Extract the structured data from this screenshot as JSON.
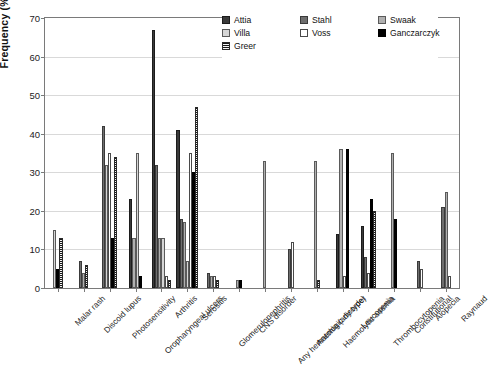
{
  "chart_data": {
    "type": "bar",
    "title": "",
    "subtitle": "",
    "xlabel": "",
    "ylabel": "Frequency (%)",
    "ylim": [
      0,
      70
    ],
    "ytick_step": 10,
    "yticks": [
      0,
      10,
      20,
      30,
      40,
      50,
      60,
      70
    ],
    "grid": true,
    "legend_position": "top-center",
    "categories": [
      "Malar rash",
      "Discoid lupus",
      "Photosensitivity",
      "Oropharyngeal ulcers",
      "Arthritis",
      "Serositis",
      "Glomerulonephritis",
      "CNS disorder",
      "Any hematologic disorder",
      "Anemia (any type)",
      "Haemolytic anemia",
      "Leucopenia",
      "Thrombocytopenia",
      "Constitutional",
      "Alopecia",
      "Raynaud"
    ],
    "series": [
      {
        "name": "Attia",
        "color": "#3a3a3a",
        "pattern": "solid-dark-gray",
        "values": [
          null,
          null,
          null,
          23,
          67,
          41,
          null,
          null,
          null,
          null,
          null,
          14,
          16,
          null,
          null,
          null
        ]
      },
      {
        "name": "Stahl",
        "color": "#6e6e6e",
        "pattern": "solid-medium-gray",
        "values": [
          null,
          7,
          42,
          null,
          32,
          18,
          4,
          null,
          null,
          10,
          null,
          null,
          8,
          null,
          7,
          21
        ]
      },
      {
        "name": "Swaak",
        "color": "#b0b0b0",
        "pattern": "solid-light-gray",
        "values": [
          null,
          4,
          null,
          13,
          13,
          17,
          3,
          2,
          33,
          null,
          33,
          36,
          null,
          35,
          null,
          25
        ]
      },
      {
        "name": "Villa",
        "color": "#d6d6d6",
        "pattern": "solid-very-light-gray",
        "values": [
          15,
          null,
          32,
          35,
          13,
          7,
          null,
          null,
          null,
          null,
          null,
          null,
          null,
          null,
          null,
          null
        ]
      },
      {
        "name": "Voss",
        "color": "#ffffff",
        "pattern": "white-outline",
        "values": [
          null,
          null,
          35,
          null,
          3,
          35,
          3,
          null,
          null,
          12,
          null,
          3,
          4,
          null,
          5,
          3
        ]
      },
      {
        "name": "Ganczarczyk",
        "color": "#000000",
        "pattern": "solid-black",
        "values": [
          5,
          null,
          13,
          3,
          null,
          30,
          null,
          2,
          null,
          null,
          null,
          36,
          23,
          18,
          null,
          null
        ]
      },
      {
        "name": "Greer",
        "color": "#1a1a1a",
        "pattern": "horizontal-stripes",
        "values": [
          13,
          6,
          34,
          null,
          2,
          47,
          2,
          null,
          null,
          null,
          2,
          null,
          20,
          null,
          null,
          null
        ]
      }
    ]
  },
  "axes": {
    "y_title": "Frequency (%)",
    "y_tick_labels": [
      "0",
      "10",
      "20",
      "30",
      "40",
      "50",
      "60",
      "70"
    ]
  },
  "legend": {
    "entries": [
      {
        "label": "Attia",
        "swatch_class": "sw-attia"
      },
      {
        "label": "Stahl",
        "swatch_class": "sw-stahl"
      },
      {
        "label": "Swaak",
        "swatch_class": "sw-swaak"
      },
      {
        "label": "Villa",
        "swatch_class": "sw-villa"
      },
      {
        "label": "Voss",
        "swatch_class": "sw-voss"
      },
      {
        "label": "Ganczarczyk",
        "swatch_class": "sw-ganczarczyk"
      },
      {
        "label": "Greer",
        "swatch_class": "sw-greer"
      }
    ]
  }
}
